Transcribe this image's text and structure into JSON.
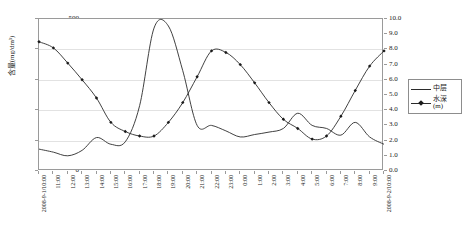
{
  "chart_data": {
    "type": "line",
    "title": "",
    "xlabel": "",
    "ylabel": "含量(mg/dm³)",
    "y2label": "水深(m)",
    "grid": true,
    "legend_position": "right",
    "ylim": [
      0,
      500
    ],
    "y2lim": [
      0,
      10
    ],
    "yticks": [
      "0",
      "100",
      "200",
      "300",
      "400",
      "500"
    ],
    "y2ticks": [
      "0.0",
      "1.0",
      "2.0",
      "3.0",
      "4.0",
      "5.0",
      "6.0",
      "7.0",
      "8.0",
      "9.0",
      "10.0"
    ],
    "categories": [
      "2008-9-1/10:00",
      "11:00",
      "12:00",
      "13:00",
      "14:00",
      "15:00",
      "16:00",
      "17:00",
      "18:00",
      "19:00",
      "20:00",
      "21:00",
      "22:00",
      "23:00",
      "0:00",
      "1:00",
      "2:00",
      "3:00",
      "4:00",
      "5:00",
      "6:00",
      "7:00",
      "8:00",
      "9:00",
      "2008-9-2/10:00"
    ],
    "series": [
      {
        "name": "中层",
        "axis": "left",
        "markers": false,
        "values": [
          72,
          62,
          50,
          68,
          110,
          88,
          96,
          215,
          470,
          477,
          330,
          150,
          150,
          132,
          112,
          120,
          128,
          140,
          190,
          150,
          140,
          118,
          160,
          112,
          88
        ]
      },
      {
        "name": "水深(m)",
        "axis": "right",
        "markers": true,
        "values": [
          8.5,
          8.1,
          7.1,
          6.0,
          4.8,
          3.2,
          2.6,
          2.3,
          2.3,
          3.2,
          4.5,
          6.2,
          7.9,
          7.8,
          7.0,
          5.8,
          4.5,
          3.4,
          2.8,
          2.1,
          2.3,
          3.6,
          5.3,
          6.9,
          7.9
        ]
      }
    ]
  },
  "legend": {
    "items": [
      {
        "label": "中层",
        "with_marker": false
      },
      {
        "label": "水深\n(m)",
        "label_line1": "水深",
        "label_line2": "(m)",
        "with_marker": true
      }
    ]
  },
  "colors": {
    "line": "#2b2b2b",
    "marker": "#1a1a1a",
    "grid": "#e2e2e2",
    "frame": "#9a9a9a",
    "background": "#ffffff"
  }
}
